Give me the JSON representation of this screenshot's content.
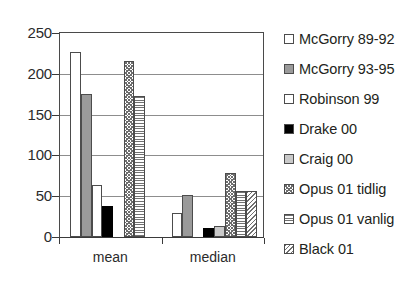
{
  "chart_data": {
    "type": "bar",
    "title": "",
    "subtitle": "",
    "xlabel": "",
    "ylabel": "",
    "categories": [
      "mean",
      "median"
    ],
    "ylim": [
      0,
      250
    ],
    "yticks": [
      0,
      50,
      100,
      150,
      200,
      250
    ],
    "ytick_labels": [
      "0",
      "50",
      "100",
      "150",
      "200",
      "250"
    ],
    "grid": true,
    "grid_axis": "y",
    "legend_position": "right",
    "series": [
      {
        "name": "McGorry 89-92",
        "pattern": "white",
        "values": [
          227,
          30
        ]
      },
      {
        "name": "McGorry 93-95",
        "pattern": "gray",
        "values": [
          175,
          52
        ]
      },
      {
        "name": "Robinson 99",
        "pattern": "white",
        "values": [
          64,
          null
        ]
      },
      {
        "name": "Drake 00",
        "pattern": "black",
        "values": [
          38,
          11
        ]
      },
      {
        "name": "Craig 00",
        "pattern": "ltgray",
        "values": [
          null,
          14
        ]
      },
      {
        "name": "Opus 01 tidlig",
        "pattern": "dots",
        "values": [
          216,
          78
        ]
      },
      {
        "name": "Opus 01 vanlig",
        "pattern": "hlines",
        "values": [
          173,
          57
        ]
      },
      {
        "name": "Black 01",
        "pattern": "diag",
        "values": [
          null,
          57
        ]
      }
    ]
  },
  "axis": {
    "y_labels": [
      "250",
      "200",
      "150",
      "100",
      "50",
      "0"
    ],
    "x_labels": [
      "mean",
      "median"
    ]
  },
  "legend": {
    "items": [
      {
        "label": "McGorry 89-92"
      },
      {
        "label": "McGorry 93-95"
      },
      {
        "label": "Robinson 99"
      },
      {
        "label": "Drake 00"
      },
      {
        "label": "Craig 00"
      },
      {
        "label": "Opus 01 tidlig"
      },
      {
        "label": "Opus 01 vanlig"
      },
      {
        "label": "Black 01"
      }
    ]
  },
  "colors": {
    "axis": "#3a3a3a",
    "grid": "#8d8d8d",
    "bar_outline": "#4c4c4c",
    "gray_fill": "#9a9a9a",
    "light_gray_fill": "#c9c9c9",
    "black_fill": "#000000",
    "background": "#ffffff"
  }
}
